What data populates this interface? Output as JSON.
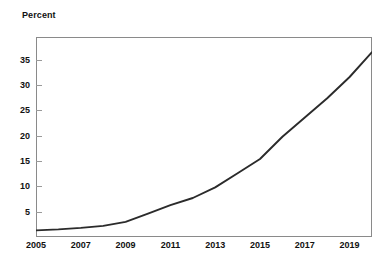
{
  "chart_data": {
    "type": "line",
    "title": "",
    "ylabel": "Percent",
    "xlabel": "",
    "ylim": [
      0,
      39.5
    ],
    "xlim": [
      2005,
      2020
    ],
    "grid": false,
    "legend": null,
    "y_ticks": [
      5,
      10,
      15,
      20,
      25,
      30,
      35
    ],
    "x_ticks": [
      2005,
      2007,
      2009,
      2011,
      2013,
      2015,
      2017,
      2019
    ],
    "line_color": "#2b2b2b",
    "series": [
      {
        "name": "Percent",
        "x": [
          2005,
          2006,
          2007,
          2008,
          2009,
          2010,
          2011,
          2012,
          2013,
          2014,
          2015,
          2016,
          2017,
          2018,
          2019,
          2020
        ],
        "values": [
          1.3,
          1.5,
          1.8,
          2.2,
          3.0,
          4.6,
          6.3,
          7.7,
          9.8,
          12.6,
          15.4,
          19.8,
          23.6,
          27.4,
          31.6,
          36.5
        ]
      }
    ]
  },
  "axis": {
    "y_title": "Percent",
    "y_labels": [
      "35",
      "30",
      "25",
      "20",
      "15",
      "10",
      "5"
    ],
    "x_labels": [
      "2005",
      "2007",
      "2009",
      "2011",
      "2013",
      "2015",
      "2017",
      "2019"
    ]
  }
}
